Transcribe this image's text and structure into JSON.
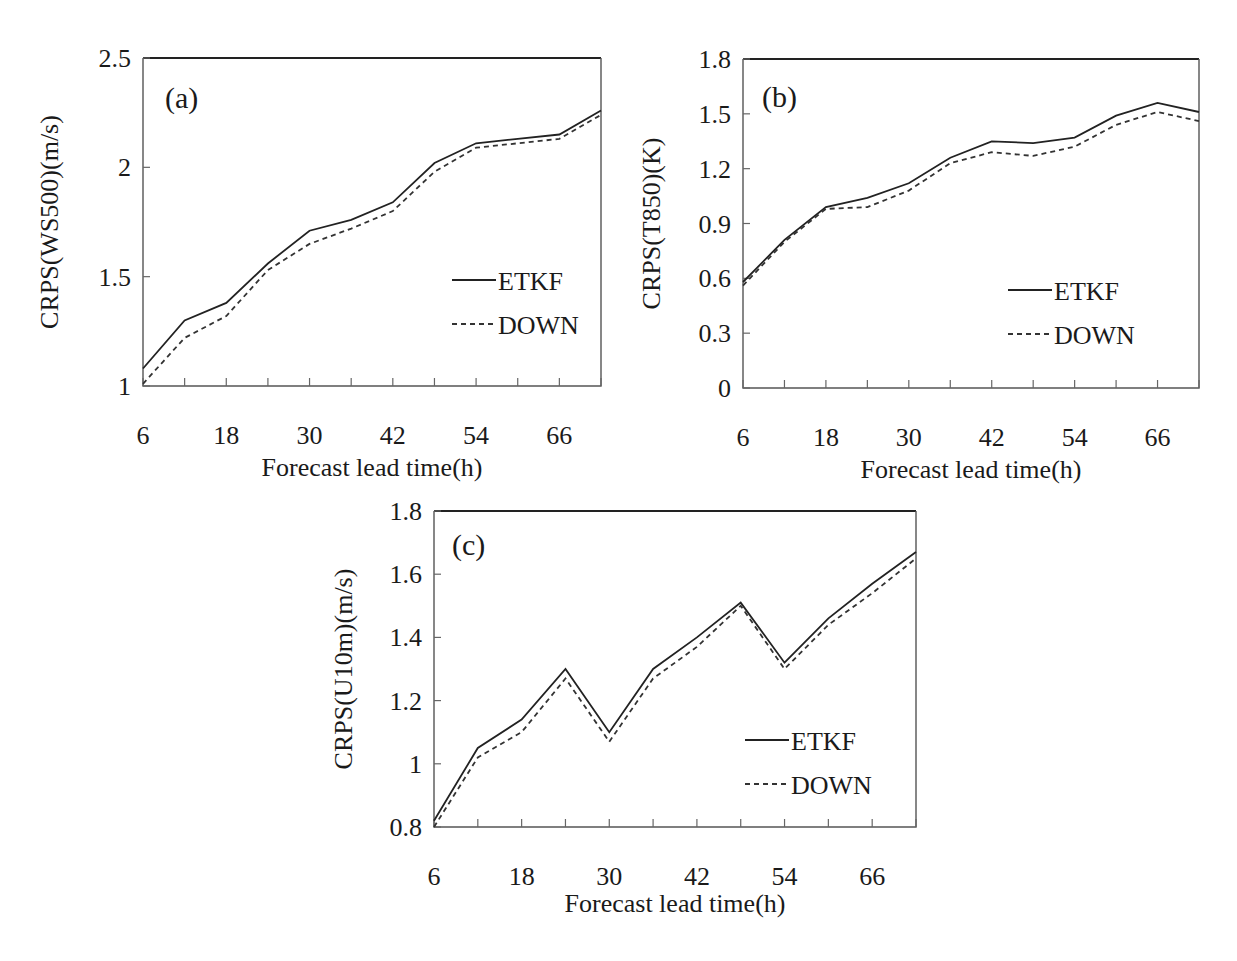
{
  "figure": {
    "x_axis_title": "Forecast lead time(h)",
    "legend": [
      {
        "name": "ETKF",
        "style": "solid"
      },
      {
        "name": "DOWN",
        "style": "dashed"
      }
    ]
  },
  "chart_data": [
    {
      "type": "line",
      "panel": "(a)",
      "title": "",
      "xlabel": "Forecast lead time(h)",
      "ylabel": "CRPS(WS500)(m/s)",
      "x": [
        6,
        12,
        18,
        24,
        30,
        36,
        42,
        48,
        54,
        60,
        66,
        72
      ],
      "xticks": [
        6,
        18,
        30,
        42,
        54,
        66
      ],
      "xlim": [
        6,
        72
      ],
      "ylim": [
        1,
        2.5
      ],
      "yticks": [
        1,
        1.5,
        2,
        2.5
      ],
      "ytick_labels": [
        "1",
        "1.5",
        "2",
        "2.5"
      ],
      "grid": false,
      "legend_position": "lower right",
      "series": [
        {
          "name": "ETKF",
          "style": "solid",
          "values": [
            1.08,
            1.3,
            1.38,
            1.56,
            1.71,
            1.76,
            1.84,
            2.02,
            2.11,
            2.13,
            2.15,
            2.26
          ]
        },
        {
          "name": "DOWN",
          "style": "dashed",
          "values": [
            1.01,
            1.22,
            1.32,
            1.53,
            1.65,
            1.72,
            1.8,
            1.98,
            2.09,
            2.11,
            2.13,
            2.24
          ]
        }
      ]
    },
    {
      "type": "line",
      "panel": "(b)",
      "title": "",
      "xlabel": "Forecast lead time(h)",
      "ylabel": "CRPS(T850)(K)",
      "x": [
        6,
        12,
        18,
        24,
        30,
        36,
        42,
        48,
        54,
        60,
        66,
        72
      ],
      "xticks": [
        6,
        18,
        30,
        42,
        54,
        66
      ],
      "xlim": [
        6,
        72
      ],
      "ylim": [
        0,
        1.8
      ],
      "yticks": [
        0,
        0.3,
        0.6,
        0.9,
        1.2,
        1.5,
        1.8
      ],
      "ytick_labels": [
        "0",
        "0.3",
        "0.6",
        "0.9",
        "1.2",
        "1.5",
        "1.8"
      ],
      "grid": false,
      "legend_position": "lower right",
      "series": [
        {
          "name": "ETKF",
          "style": "solid",
          "values": [
            0.58,
            0.81,
            0.99,
            1.04,
            1.12,
            1.26,
            1.35,
            1.34,
            1.37,
            1.49,
            1.56,
            1.51
          ]
        },
        {
          "name": "DOWN",
          "style": "dashed",
          "values": [
            0.56,
            0.8,
            0.98,
            0.99,
            1.08,
            1.23,
            1.29,
            1.27,
            1.32,
            1.44,
            1.51,
            1.46
          ]
        }
      ]
    },
    {
      "type": "line",
      "panel": "(c)",
      "title": "",
      "xlabel": "Forecast lead time(h)",
      "ylabel": "CRPS(U10m)(m/s)",
      "x": [
        6,
        12,
        18,
        24,
        30,
        36,
        42,
        48,
        54,
        60,
        66,
        72
      ],
      "xticks": [
        6,
        18,
        30,
        42,
        54,
        66
      ],
      "xlim": [
        6,
        72
      ],
      "ylim": [
        0.8,
        1.8
      ],
      "yticks": [
        0.8,
        1.0,
        1.2,
        1.4,
        1.6,
        1.8
      ],
      "ytick_labels": [
        "0.8",
        "1",
        "1.2",
        "1.4",
        "1.6",
        "1.8"
      ],
      "grid": false,
      "legend_position": "lower right",
      "series": [
        {
          "name": "ETKF",
          "style": "solid",
          "values": [
            0.82,
            1.05,
            1.14,
            1.3,
            1.1,
            1.3,
            1.4,
            1.51,
            1.32,
            1.46,
            1.57,
            1.67
          ]
        },
        {
          "name": "DOWN",
          "style": "dashed",
          "values": [
            0.8,
            1.02,
            1.1,
            1.27,
            1.07,
            1.27,
            1.37,
            1.5,
            1.3,
            1.44,
            1.54,
            1.65
          ]
        }
      ]
    }
  ]
}
